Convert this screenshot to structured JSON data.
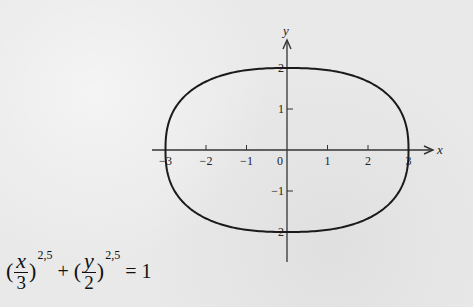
{
  "chart_data": {
    "type": "line",
    "title": "",
    "equation": {
      "x_numerator": "x",
      "x_denominator": "3",
      "y_numerator": "y",
      "y_denominator": "2",
      "exponent": "2,5",
      "plus": "+",
      "equals": "= 1"
    },
    "curve": "superellipse |x/3|^2.5 + |y/2|^2.5 = 1",
    "a": 3,
    "b": 2,
    "n": 2.5,
    "xlabel": "x",
    "ylabel": "y",
    "xlim": [
      -3.4,
      3.6
    ],
    "ylim": [
      -2.7,
      2.6
    ],
    "x_ticks": [
      "-3",
      "-2",
      "-1",
      "0",
      "1",
      "2",
      "3"
    ],
    "y_ticks": [
      "2",
      "1",
      "-1",
      "-2"
    ],
    "grid": false,
    "intercepts": {
      "x": [
        -3,
        3
      ],
      "y": [
        -2,
        2
      ]
    }
  },
  "colors": {
    "curve": "#1a1a1a",
    "axis": "#333333",
    "background": "#e9e9e9"
  }
}
